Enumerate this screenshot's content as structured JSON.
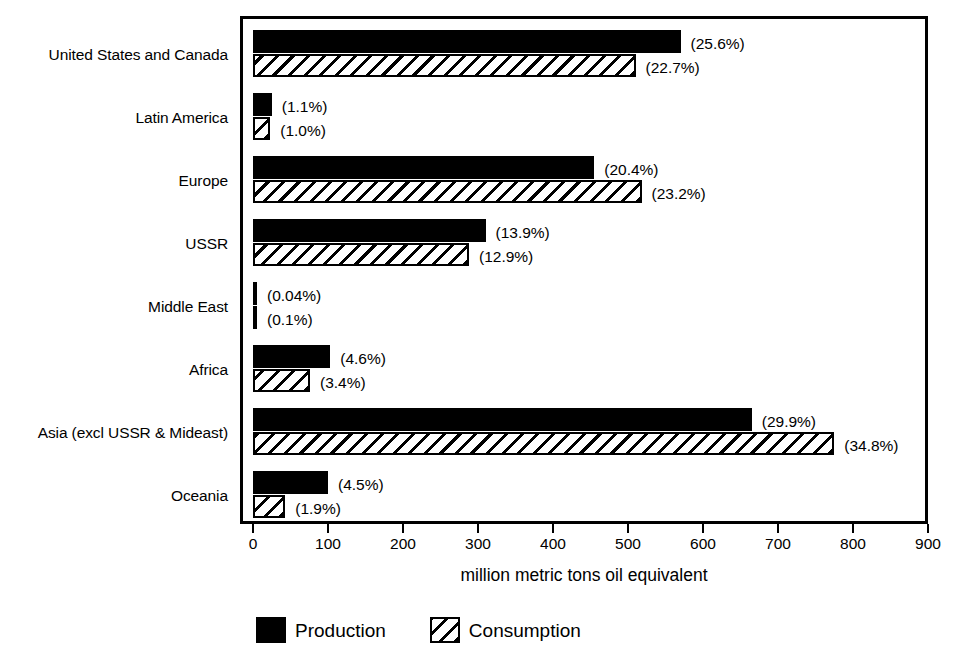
{
  "chart_data": {
    "type": "bar",
    "orientation": "horizontal",
    "title": "",
    "xlabel": "million metric tons oil equivalent",
    "ylabel": "",
    "xlim": [
      0,
      900
    ],
    "xticks": [
      0,
      100,
      200,
      300,
      400,
      500,
      600,
      700,
      800,
      900
    ],
    "xtick_labels": [
      "0",
      "100",
      "200",
      "300",
      "400",
      "500",
      "600",
      "700",
      "800",
      "900"
    ],
    "grid": false,
    "legend_position": "bottom",
    "categories": [
      "United States and Canada",
      "Latin America",
      "Europe",
      "USSR",
      "Middle East",
      "Africa",
      "Asia (excl USSR & Mideast)",
      "Oceania"
    ],
    "series": [
      {
        "name": "Production",
        "color": "#000000",
        "fill": "solid",
        "values": [
          570,
          25,
          455,
          310,
          1,
          103,
          665,
          100
        ],
        "labels": [
          "(25.6%)",
          "(1.1%)",
          "(20.4%)",
          "(13.9%)",
          "(0.04%)",
          "(4.6%)",
          "(29.9%)",
          "(4.5%)"
        ]
      },
      {
        "name": "Consumption",
        "color": "#000000",
        "fill": "diagonal-hatch",
        "values": [
          510,
          23,
          518,
          288,
          2,
          76,
          775,
          43
        ],
        "labels": [
          "(22.7%)",
          "(1.0%)",
          "(23.2%)",
          "(12.9%)",
          "(0.1%)",
          "(3.4%)",
          "(34.8%)",
          "(1.9%)"
        ]
      }
    ]
  },
  "legend": {
    "items": [
      {
        "label": "Production",
        "swatch": "solid-black-swatch"
      },
      {
        "label": "Consumption",
        "swatch": "hatched-swatch"
      }
    ]
  }
}
